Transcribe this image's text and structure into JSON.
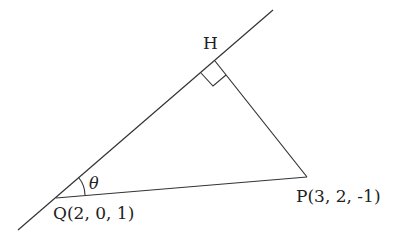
{
  "diagram": {
    "points": {
      "H": {
        "label": "H"
      },
      "P": {
        "label": "P(3, 2, -1)",
        "coords": [
          3,
          2,
          -1
        ]
      },
      "Q": {
        "label": "Q(2, 0, 1)",
        "coords": [
          2,
          0,
          1
        ]
      }
    },
    "angle_label": "θ",
    "right_angle_at": "H",
    "line_color": "#333333"
  }
}
